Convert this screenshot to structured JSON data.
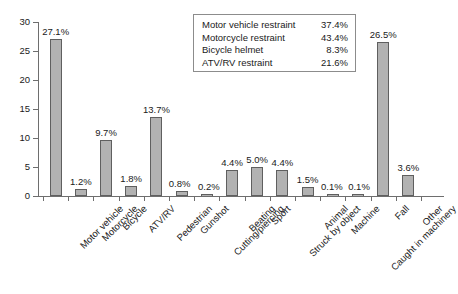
{
  "chart_data": {
    "type": "bar",
    "title": "",
    "subtitle": "",
    "xlabel": "",
    "ylabel": "",
    "ylim": [
      0,
      30
    ],
    "yticks": [
      0,
      5,
      10,
      15,
      20,
      25,
      30
    ],
    "ytick_labels": [
      "0",
      "5",
      "10",
      "15",
      "20",
      "25",
      "30"
    ],
    "grid": false,
    "legend_position": "top-center",
    "bar_color": "#b2b2b2",
    "bar_edge_color": "#5f5f5f",
    "axis_color": "#6e6e6e",
    "categories": [
      "Motor vehicle",
      "Motorcycle",
      "Bicycle",
      "ATV/RV",
      "Pedestrian",
      "Gunshot",
      "Cutting/piercing",
      "Beating",
      "Sport",
      "Struck by object",
      "Animal",
      "Machine",
      "Caught in machinery",
      "Fall",
      "Other"
    ],
    "values": [
      27.1,
      1.2,
      9.7,
      1.8,
      13.7,
      0.8,
      0.2,
      4.4,
      5.0,
      4.4,
      1.5,
      0.1,
      0.1,
      26.5,
      3.6
    ],
    "value_labels": [
      "27.1%",
      "1.2%",
      "9.7%",
      "1.8%",
      "13.7%",
      "0.8%",
      "0.2%",
      "4.4%",
      "5.0%",
      "4.4%",
      "1.5%",
      "0.1%",
      "0.1%",
      "26.5%",
      "3.6%"
    ]
  },
  "legend": {
    "rows": [
      {
        "label": "Motor vehicle restraint",
        "value": "37.4%"
      },
      {
        "label": "Motorcycle restraint",
        "value": "43.4%"
      },
      {
        "label": "Bicycle helmet",
        "value": "8.3%"
      },
      {
        "label": "ATV/RV restraint",
        "value": "21.6%"
      }
    ]
  }
}
